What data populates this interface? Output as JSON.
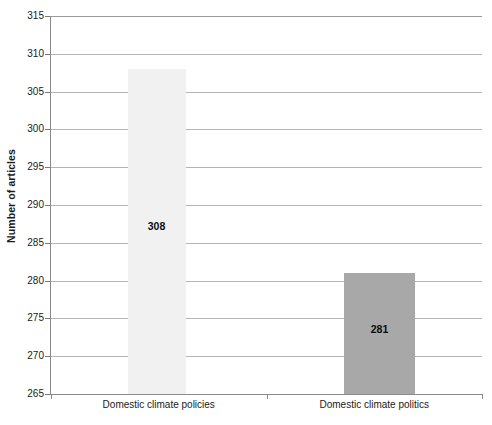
{
  "chart_data": {
    "type": "bar",
    "title": "",
    "xlabel": "",
    "ylabel": "Number of articles",
    "categories": [
      "Domestic climate policies",
      "Domestic climate politics"
    ],
    "values": [
      308,
      281
    ],
    "value_labels": [
      "308",
      "281"
    ],
    "ylim": [
      265,
      315
    ],
    "ytick_step": 5,
    "yticks": [
      265,
      270,
      275,
      280,
      285,
      290,
      295,
      300,
      305,
      310,
      315
    ],
    "ytick_labels": [
      "265",
      "270",
      "275",
      "280",
      "285",
      "290",
      "295",
      "300",
      "305",
      "310",
      "315"
    ],
    "grid": true,
    "grid_axis": "y",
    "legend": null,
    "series": [
      {
        "name": "Number of articles",
        "values": [
          308,
          281
        ],
        "colors": [
          "#f1f1f1",
          "#a8a8a8"
        ]
      }
    ],
    "bar_colors": {
      "domestic_climate_policies": "#f1f1f1",
      "domestic_climate_politics": "#a8a8a8"
    },
    "axis_color": "#8a8a8a",
    "grid_color": "#b4b4b4",
    "background": "#ffffff"
  },
  "axes": {
    "y_title": "Number of articles"
  }
}
